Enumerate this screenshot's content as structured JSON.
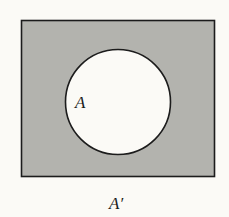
{
  "diagram": {
    "type": "venn",
    "universe": {
      "fill": "#b3b3ae",
      "stroke": "#1c1c1c"
    },
    "set": {
      "fill": "#fbfaf6",
      "stroke": "#1c1c1c"
    },
    "labels": {
      "set_label": "A",
      "complement_label": "A′"
    }
  }
}
